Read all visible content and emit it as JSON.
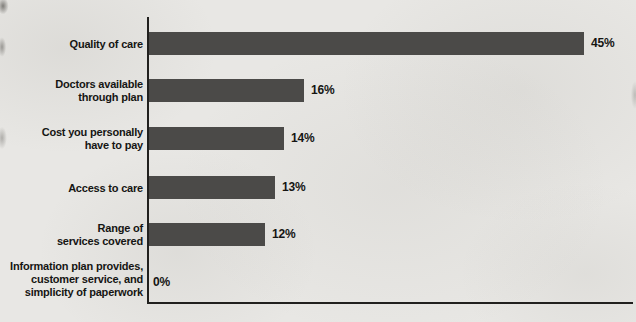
{
  "chart_data": {
    "type": "bar",
    "orientation": "horizontal",
    "title": "",
    "xlabel": "",
    "ylabel": "",
    "xlim": [
      0,
      47
    ],
    "grid": false,
    "legend": false,
    "bar_color": "#4b4a48",
    "axis_color": "#21201e",
    "text_color": "#151513",
    "background_color": "#e8e7e4",
    "categories": [
      "Quality of care",
      "Doctors available through plan",
      "Cost you personally have to pay",
      "Access to care",
      "Range of services covered",
      "Information plan provides, customer service, and simplicity of paperwork"
    ],
    "category_lines": [
      [
        "Quality of care"
      ],
      [
        "Doctors available",
        "through plan"
      ],
      [
        "Cost you personally",
        "have to pay"
      ],
      [
        "Access to care"
      ],
      [
        "Range of",
        "services covered"
      ],
      [
        "Information plan provides,",
        "customer service, and",
        "simplicity of paperwork"
      ]
    ],
    "values": [
      45,
      16,
      14,
      13,
      12,
      0
    ],
    "value_labels": [
      "45%",
      "16%",
      "14%",
      "13%",
      "12%",
      "0%"
    ]
  }
}
